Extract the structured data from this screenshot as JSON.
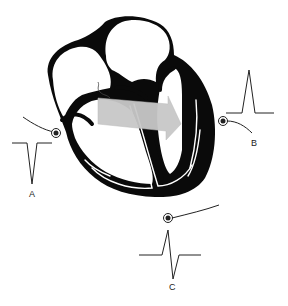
{
  "diagram": {
    "type": "heart-electrical-axis",
    "colors": {
      "heart_wall": "#0a0a0a",
      "conduction_lines": "#ffffff",
      "vector_arrow": "#c8c8c8",
      "trace": "#222222",
      "background": "#ffffff"
    },
    "arrow": {
      "label": "",
      "direction": "left-to-right, slightly downward"
    },
    "leads": [
      {
        "id": "A",
        "label": "A",
        "deflection": "negative",
        "position": "left"
      },
      {
        "id": "B",
        "label": "B",
        "deflection": "positive",
        "position": "right"
      },
      {
        "id": "C",
        "label": "C",
        "deflection": "biphasic",
        "position": "bottom"
      }
    ]
  }
}
